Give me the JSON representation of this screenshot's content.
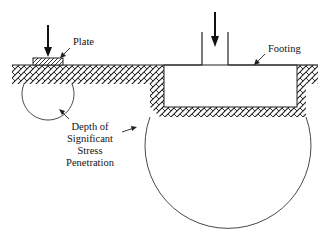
{
  "diagram": {
    "labels": {
      "plate": "Plate",
      "footing": "Footing",
      "depth_line1": "Depth of",
      "depth_line2": "Significant",
      "depth_line3": "Stress",
      "depth_line4": "Penetration"
    },
    "elements": [
      {
        "name": "plate",
        "description": "small hatched bearing plate on ground surface with downward load arrow"
      },
      {
        "name": "plate-stress-bulb",
        "description": "small circle below plate showing shallow stress zone"
      },
      {
        "name": "footing",
        "description": "wide footing with column, set in excavated pit, with downward load arrow"
      },
      {
        "name": "footing-stress-bulb",
        "description": "large circle below footing showing deep stress zone"
      },
      {
        "name": "soil",
        "description": "hatched ground surface"
      }
    ],
    "colors": {
      "line": "#222222",
      "background": "#ffffff"
    }
  }
}
